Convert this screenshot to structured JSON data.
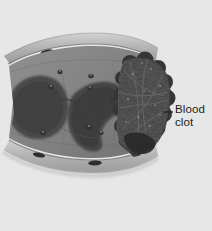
{
  "figure": {
    "name": "blood-vessel-cross-section-with-clot",
    "type": "grayscale-anatomical-illustration",
    "background_color": "#e8e8e8",
    "width": 212,
    "height": 231,
    "annotations": [
      {
        "id": "blood-clot",
        "label_line_1": "Blood",
        "label_line_2": "clot",
        "leader_line": {
          "from_x": 163,
          "from_y": 112,
          "to_x": 173,
          "to_y": 112,
          "color": "#1d1d1d"
        },
        "text_color": "#1d1d1d",
        "text_x": 175,
        "text_y": 103
      }
    ],
    "structures": [
      {
        "name": "vessel-wall-upper",
        "fill": "#b9b9b9",
        "nuclei_count": 3,
        "nuclei_color": "#2e2e2e"
      },
      {
        "name": "vessel-wall-lower",
        "fill": "#bdbdbd",
        "nuclei_count": 3,
        "nuclei_color": "#2e2e2e"
      },
      {
        "name": "vessel-lumen-interior",
        "fill": "#8a8a8a"
      },
      {
        "name": "dark-tissue-mass-left",
        "fill": "#4a4a4a"
      },
      {
        "name": "dark-tissue-mass-center",
        "fill": "#444444"
      },
      {
        "name": "blood-clot-mass",
        "fill": "#3a3a3a",
        "texture": "mottled-granular-with-fibrin-strands"
      }
    ],
    "palette": {
      "background": "#e8e8e8",
      "wall_light": "#c6c6c6",
      "wall_mid": "#a8a8a8",
      "lumen": "#8a8a8a",
      "tissue_dark": "#474747",
      "clot_dark": "#303030",
      "clot_mid": "#4e4e4e",
      "nucleus": "#262626",
      "ink": "#1d1d1d"
    }
  }
}
